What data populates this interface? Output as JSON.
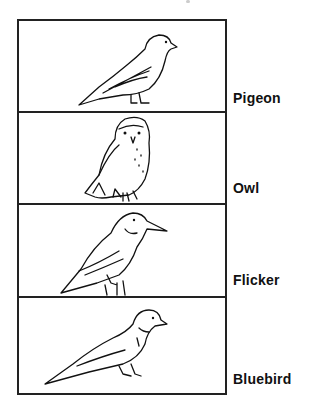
{
  "birds": [
    {
      "name": "Pigeon",
      "icon": "pigeon-drawing"
    },
    {
      "name": "Owl",
      "icon": "owl-drawing"
    },
    {
      "name": "Flicker",
      "icon": "flicker-drawing"
    },
    {
      "name": "Bluebird",
      "icon": "bluebird-drawing"
    }
  ],
  "colors": {
    "ink": "#111111",
    "background": "#ffffff"
  }
}
